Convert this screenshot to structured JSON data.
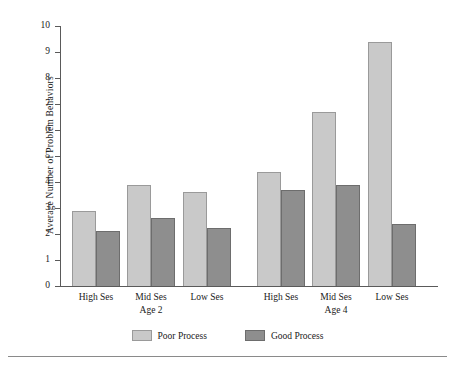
{
  "chart_data": {
    "type": "bar",
    "title": "",
    "subtitle": "",
    "xlabel": "",
    "ylabel": "Average Number of Problem Behaviors",
    "ylim": [
      0,
      10
    ],
    "ytick_step": 1,
    "ytick_labels": [
      "10",
      "9",
      "8",
      "7",
      "6",
      "5",
      "4",
      "3",
      "2",
      "1",
      "0"
    ],
    "grid": false,
    "legend_position": "bottom",
    "groups": [
      "Age 2",
      "Age 4"
    ],
    "categories": [
      "High Ses",
      "Mid Ses",
      "Low Ses",
      "High Ses",
      "Mid Ses",
      "Low Ses"
    ],
    "series": [
      {
        "name": "Poor Process",
        "color": "#c9c9c9",
        "values": [
          2.9,
          3.9,
          3.6,
          4.4,
          6.7,
          9.4
        ]
      },
      {
        "name": "Good Process",
        "color": "#8e8e8e",
        "values": [
          2.1,
          2.6,
          2.25,
          3.7,
          3.9,
          2.4
        ]
      }
    ],
    "bars": [
      {
        "group": "Age 2",
        "category": "High Ses",
        "series": "Poor Process",
        "value": 2.9
      },
      {
        "group": "Age 2",
        "category": "High Ses",
        "series": "Good Process",
        "value": 2.1
      },
      {
        "group": "Age 2",
        "category": "Mid Ses",
        "series": "Poor Process",
        "value": 3.9
      },
      {
        "group": "Age 2",
        "category": "Mid Ses",
        "series": "Good Process",
        "value": 2.6
      },
      {
        "group": "Age 2",
        "category": "Low Ses",
        "series": "Poor Process",
        "value": 3.6
      },
      {
        "group": "Age 2",
        "category": "Low Ses",
        "series": "Good Process",
        "value": 2.25
      },
      {
        "group": "Age 4",
        "category": "High Ses",
        "series": "Poor Process",
        "value": 4.4
      },
      {
        "group": "Age 4",
        "category": "High Ses",
        "series": "Good Process",
        "value": 3.7
      },
      {
        "group": "Age 4",
        "category": "Mid Ses",
        "series": "Poor Process",
        "value": 6.7
      },
      {
        "group": "Age 4",
        "category": "Mid Ses",
        "series": "Good Process",
        "value": 3.9
      },
      {
        "group": "Age 4",
        "category": "Low Ses",
        "series": "Poor Process",
        "value": 9.4
      },
      {
        "group": "Age 4",
        "category": "Low Ses",
        "series": "Good Process",
        "value": 2.4
      }
    ]
  },
  "axis": {
    "y_title": "Average Number of Problem Behaviors",
    "ticks": [
      "10",
      "9",
      "8",
      "7",
      "6",
      "5",
      "4",
      "3",
      "2",
      "1",
      "0"
    ]
  },
  "categories": [
    {
      "label": "High Ses"
    },
    {
      "label": "Mid Ses"
    },
    {
      "label": "Low Ses"
    },
    {
      "label": "High Ses"
    },
    {
      "label": "Mid Ses"
    },
    {
      "label": "Low Ses"
    }
  ],
  "group_labels": [
    {
      "label": "Age 2"
    },
    {
      "label": "Age 4"
    }
  ],
  "legend": {
    "items": [
      {
        "label": "Poor Process",
        "color": "#c9c9c9"
      },
      {
        "label": "Good Process",
        "color": "#8e8e8e"
      }
    ]
  }
}
